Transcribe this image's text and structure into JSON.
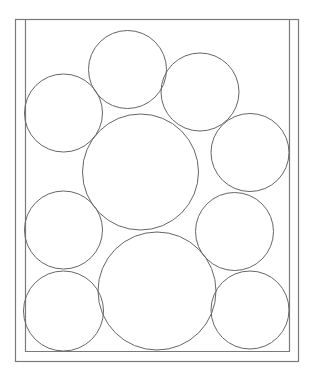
{
  "diagram": {
    "type": "circle-packing-in-container",
    "width": 313,
    "height": 379,
    "colors": {
      "background": "#ffffff",
      "frame_stroke": "#7a7a7a",
      "circle_stroke": "#666666"
    },
    "frame": {
      "outer": {
        "x": 15,
        "y": 19,
        "w": 283,
        "h": 342
      },
      "inner": {
        "left": 25,
        "right": 289,
        "top": 19,
        "bottom": 351
      }
    },
    "circles": [
      {
        "id": "top-center",
        "cx": 127.5,
        "cy": 69.5,
        "r": 39
      },
      {
        "id": "top-right",
        "cx": 200,
        "cy": 92,
        "r": 39
      },
      {
        "id": "upper-left",
        "cx": 63.5,
        "cy": 113,
        "r": 39
      },
      {
        "id": "large-middle",
        "cx": 140.5,
        "cy": 172,
        "r": 58
      },
      {
        "id": "right-middle",
        "cx": 250,
        "cy": 152.5,
        "r": 39
      },
      {
        "id": "left-middle",
        "cx": 63.5,
        "cy": 230,
        "r": 39
      },
      {
        "id": "right-lower-middle",
        "cx": 234.5,
        "cy": 231.5,
        "r": 39
      },
      {
        "id": "large-bottom",
        "cx": 157,
        "cy": 291,
        "r": 59
      },
      {
        "id": "bottom-left",
        "cx": 63.5,
        "cy": 311,
        "r": 40
      },
      {
        "id": "bottom-right",
        "cx": 250,
        "cy": 310,
        "r": 39
      }
    ]
  }
}
